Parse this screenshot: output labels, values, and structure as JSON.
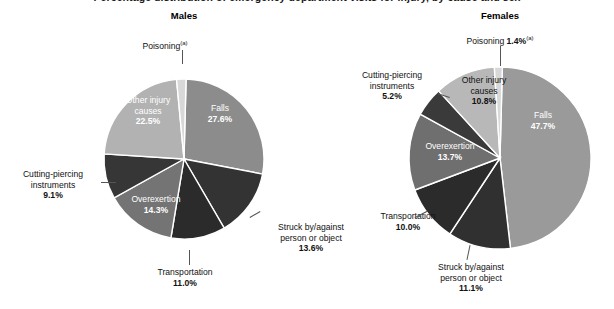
{
  "figure": {
    "cut_off_title": "Percentage distribution of emergency department visits for injury, by cause and sex",
    "panels": [
      {
        "name": "males",
        "title": "Males"
      },
      {
        "name": "females",
        "title": "Females"
      }
    ],
    "footnote_marker": "(a)"
  },
  "chart_data": {
    "type": "pie",
    "title": "Percentage distribution of emergency department visits for injury, by cause and sex",
    "charts": [
      {
        "name": "Males",
        "title": "Males",
        "units": "percent",
        "categories": [
          "Falls",
          "Struck by/against person or object",
          "Transportation",
          "Overexertion",
          "Cutting-piercing instruments",
          "Other injury causes",
          "Poisoning"
        ],
        "values": [
          27.6,
          13.6,
          11.0,
          14.3,
          9.1,
          22.5,
          1.9
        ],
        "labels": [
          {
            "name": "Falls",
            "text": "Falls",
            "pct": "27.6%",
            "placement": "inside",
            "color": "#8c8c8c"
          },
          {
            "name": "Struck by/against person or object",
            "text": "Struck by/against person or object",
            "pct": "13.6%",
            "placement": "outside",
            "color": "#333333"
          },
          {
            "name": "Transportation",
            "text": "Transportation",
            "pct": "11.0%",
            "placement": "outside",
            "color": "#2b2b2b"
          },
          {
            "name": "Overexertion",
            "text": "Overexertion",
            "pct": "14.3%",
            "placement": "inside",
            "color": "#747474"
          },
          {
            "name": "Cutting-piercing instruments",
            "text": "Cutting-piercing instruments",
            "pct": "9.1%",
            "placement": "outside",
            "color": "#363636"
          },
          {
            "name": "Other injury causes",
            "text": "Other injury causes",
            "pct": "22.5%",
            "placement": "inside",
            "color": "#b2b2b2"
          },
          {
            "name": "Poisoning",
            "text": "Poisoning",
            "pct": "",
            "placement": "outside",
            "color": "#d8d8d8"
          }
        ]
      },
      {
        "name": "Females",
        "title": "Females",
        "units": "percent",
        "categories": [
          "Falls",
          "Struck by/against person or object",
          "Transportation",
          "Overexertion",
          "Cutting-piercing instruments",
          "Other injury causes",
          "Poisoning"
        ],
        "values": [
          47.7,
          11.1,
          10.0,
          13.7,
          5.2,
          10.8,
          1.4
        ],
        "labels": [
          {
            "name": "Falls",
            "text": "Falls",
            "pct": "47.7%",
            "placement": "inside",
            "color": "#9a9a9a"
          },
          {
            "name": "Struck by/against person or object",
            "text": "Struck by/against person or object",
            "pct": "11.1%",
            "placement": "outside",
            "color": "#303030"
          },
          {
            "name": "Transportation",
            "text": "Transportation",
            "pct": "10.0%",
            "placement": "outside",
            "color": "#2b2b2b"
          },
          {
            "name": "Overexertion",
            "text": "Overexertion",
            "pct": "13.7%",
            "placement": "inside",
            "color": "#6f6f6f"
          },
          {
            "name": "Cutting-piercing instruments",
            "text": "Cutting-piercing instruments",
            "pct": "5.2%",
            "placement": "outside",
            "color": "#3a3a3a"
          },
          {
            "name": "Other injury causes",
            "text": "Other injury causes",
            "pct": "10.8%",
            "placement": "inside",
            "color": "#b8b8b8"
          },
          {
            "name": "Poisoning",
            "text": "Poisoning",
            "pct": "1.4%",
            "placement": "outside",
            "color": "#d8d8d8"
          }
        ]
      }
    ],
    "legend": "none",
    "grid": false
  },
  "males": {
    "title": "Males",
    "poisoning": {
      "label": "Poisoning",
      "sup": "(a)"
    },
    "other_injury": {
      "l1": "Other injury",
      "l2": "causes",
      "pct": "22.5%"
    },
    "falls": {
      "l1": "Falls",
      "pct": "27.6%"
    },
    "cutting": {
      "l1": "Cutting-piercing",
      "l2": "instruments",
      "pct": "9.1%"
    },
    "overexertion": {
      "l1": "Overexertion",
      "pct": "14.3%"
    },
    "transportation": {
      "l1": "Transportation",
      "pct": "11.0%"
    },
    "struck": {
      "l1": "Struck by/against",
      "l2": "person or object",
      "pct": "13.6%"
    }
  },
  "females": {
    "title": "Females",
    "poisoning": {
      "label": "Poisoning",
      "pct": "1.4%",
      "sup": "(a)"
    },
    "other_injury": {
      "l1": "Other injury",
      "l2": "causes",
      "pct": "10.8%"
    },
    "falls": {
      "l1": "Falls",
      "pct": "47.7%"
    },
    "cutting": {
      "l1": "Cutting-piercing",
      "l2": "instruments",
      "pct": "5.2%"
    },
    "overexertion": {
      "l1": "Overexertion",
      "pct": "13.7%"
    },
    "transportation": {
      "l1": "Transportation",
      "pct": "10.0%"
    },
    "struck": {
      "l1": "Struck by/against",
      "l2": "person or object",
      "pct": "11.1%"
    }
  }
}
